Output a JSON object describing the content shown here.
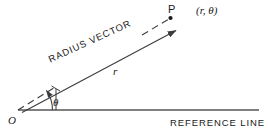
{
  "figure": {
    "type": "polar-coordinate-diagram",
    "background_color": "#ffffff",
    "line_color": "#3c3c3c",
    "text_color": "#1a1a1a"
  },
  "labels": {
    "point_p": "P",
    "coordinates": "(r, θ)",
    "origin": "O",
    "angle": "θ",
    "magnitude": "r",
    "radius_vector": "RADIUS VECTOR",
    "reference_line": "REFERENCE LINE"
  },
  "geometry": {
    "origin_point": [
      18,
      110
    ],
    "point_p": [
      170,
      18
    ],
    "reference_line_start": [
      18,
      110
    ],
    "reference_line_end": [
      259,
      110
    ],
    "radius_vector_dashed_from": [
      18,
      110
    ],
    "radius_vector_dashed_to": [
      170,
      18
    ],
    "magnitude_arrow_from": [
      22,
      112
    ],
    "magnitude_arrow_to": [
      180,
      29
    ],
    "angle_arc_radius": 35,
    "angle_degrees": 31
  }
}
